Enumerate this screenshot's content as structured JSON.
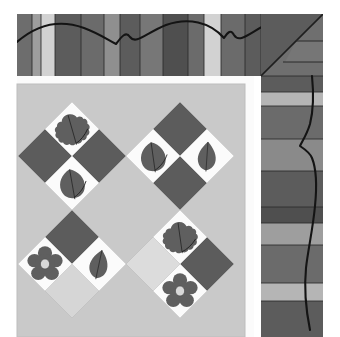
{
  "scene": {
    "title": "Quilt corner photograph",
    "subject": "appliqued leaf and flower quilt block corner with pieced striped borders",
    "canvas": {
      "width": 340,
      "height": 337,
      "background": "#ffffff"
    }
  },
  "palette": {
    "page_background": "#ffffff",
    "sashing_white": "#fbfbfb",
    "center_background": "#c9c9c9",
    "light_gray": "#d2d2d2",
    "pale_gray": "#dedede",
    "medium_gray": "#9e9e9e",
    "dark_gray": "#5c5c5c",
    "darker_gray": "#4f4f4f",
    "mid_dark_gray": "#6b6b6b",
    "appliqué_gray": "#5f5f5f",
    "flower_center": "#d8d8d8",
    "quilting_line": "#1a1a1a",
    "seam_line": "#2b2b2b"
  },
  "layout": {
    "top_border": {
      "x": 17,
      "y": 14,
      "width": 306,
      "height": 62
    },
    "right_border": {
      "x": 261,
      "y": 14,
      "width": 62,
      "height": 323
    },
    "center_panel": {
      "x": 17,
      "y": 84,
      "width": 228,
      "height": 253
    },
    "inner_sashing_vertical": {
      "x": 245,
      "y": 84,
      "width": 9,
      "height": 253
    },
    "inner_sashing_horizontal": {
      "x": 17,
      "y": 76,
      "width": 237,
      "height": 8
    },
    "corner_miter_seam": "diagonal from inner corner to outer corner of border"
  },
  "top_border": {
    "label": "pieced vertical strip border along top edge",
    "strip_count": 14,
    "strips": [
      {
        "index": 0,
        "x": 17,
        "width": 15,
        "color": "#6d6d6d"
      },
      {
        "index": 1,
        "x": 32,
        "width": 9,
        "color": "#9e9e9e"
      },
      {
        "index": 2,
        "x": 41,
        "width": 14,
        "color": "#d2d2d2"
      },
      {
        "index": 3,
        "x": 55,
        "width": 26,
        "color": "#5c5c5c"
      },
      {
        "index": 4,
        "x": 81,
        "width": 23,
        "color": "#6b6b6b"
      },
      {
        "index": 5,
        "x": 104,
        "width": 16,
        "color": "#8f8f8f"
      },
      {
        "index": 6,
        "x": 120,
        "width": 20,
        "color": "#5c5c5c"
      },
      {
        "index": 7,
        "x": 140,
        "width": 23,
        "color": "#777777"
      },
      {
        "index": 8,
        "x": 163,
        "width": 25,
        "color": "#4f4f4f"
      },
      {
        "index": 9,
        "x": 188,
        "width": 16,
        "color": "#6b6b6b"
      },
      {
        "index": 10,
        "x": 204,
        "width": 17,
        "color": "#d2d2d2"
      },
      {
        "index": 11,
        "x": 221,
        "width": 24,
        "color": "#6b6b6b"
      },
      {
        "index": 12,
        "x": 245,
        "width": 16,
        "color": "#5c5c5c"
      },
      {
        "index": 13,
        "x": 261,
        "width": 26,
        "color": "#4f4f4f"
      }
    ],
    "quilting_motif": "continuous scalloped wave with pointed dips"
  },
  "right_border": {
    "label": "pieced horizontal strip border along right edge",
    "strip_count": 12,
    "strips": [
      {
        "index": 0,
        "y": 14,
        "height": 28,
        "color": "#4f4f4f"
      },
      {
        "index": 1,
        "y": 42,
        "height": 24,
        "color": "#6b6b6b"
      },
      {
        "index": 2,
        "y": 66,
        "height": 26,
        "color": "#5c5c5c"
      },
      {
        "index": 3,
        "y": 92,
        "height": 14,
        "color": "#b5b5b5"
      },
      {
        "index": 4,
        "y": 106,
        "height": 33,
        "color": "#6b6b6b"
      },
      {
        "index": 5,
        "y": 139,
        "height": 32,
        "color": "#8a8a8a"
      },
      {
        "index": 6,
        "y": 171,
        "height": 36,
        "color": "#5c5c5c"
      },
      {
        "index": 7,
        "y": 207,
        "height": 16,
        "color": "#4f4f4f"
      },
      {
        "index": 8,
        "y": 223,
        "height": 22,
        "color": "#9e9e9e"
      },
      {
        "index": 9,
        "y": 245,
        "height": 38,
        "color": "#6b6b6b"
      },
      {
        "index": 10,
        "y": 283,
        "height": 18,
        "color": "#b5b5b5"
      },
      {
        "index": 11,
        "y": 301,
        "height": 36,
        "color": "#5c5c5c"
      }
    ],
    "quilting_motif": "vertical serpentine wave line with a sharp notch"
  },
  "center_panel": {
    "label": "on-point diamond block field",
    "background": "#c9c9c9",
    "blocks": [
      {
        "id": "block-leaf-oak-upper-left",
        "motif": "oak-leaf",
        "patch": "white",
        "cx": 72,
        "cy": 129,
        "half": 27,
        "leaf_rotation": -16
      },
      {
        "id": "block-dark-left-upper",
        "motif": "plain",
        "patch": "dark",
        "cx": 45,
        "cy": 156,
        "half": 27
      },
      {
        "id": "block-dark-right-upper",
        "motif": "plain",
        "patch": "dark",
        "cx": 99,
        "cy": 156,
        "half": 27
      },
      {
        "id": "block-leaf-round-left",
        "motif": "round-leaf",
        "patch": "white",
        "cx": 72,
        "cy": 183,
        "half": 27,
        "leaf_rotation": -10
      },
      {
        "id": "block-leaf-round-center",
        "motif": "round-leaf",
        "patch": "white",
        "cx": 153,
        "cy": 156,
        "half": 27,
        "leaf_rotation": -8
      },
      {
        "id": "block-leaf-pointed-right",
        "motif": "pointed-leaf",
        "patch": "white",
        "cx": 207,
        "cy": 156,
        "half": 27,
        "leaf_rotation": 4
      },
      {
        "id": "block-dark-center-upper",
        "motif": "plain",
        "patch": "dark",
        "cx": 180,
        "cy": 129,
        "half": 27
      },
      {
        "id": "block-dark-center-lower",
        "motif": "plain",
        "patch": "dark",
        "cx": 180,
        "cy": 183,
        "half": 27
      },
      {
        "id": "block-flower-lower-left",
        "motif": "flower",
        "patch": "white",
        "cx": 45,
        "cy": 264,
        "half": 27
      },
      {
        "id": "block-dark-lower-left",
        "motif": "plain",
        "patch": "dark",
        "cx": 72,
        "cy": 237,
        "half": 27
      },
      {
        "id": "block-leaf-pointed-lower-left",
        "motif": "pointed-leaf",
        "patch": "white",
        "cx": 99,
        "cy": 264,
        "half": 27,
        "leaf_rotation": 12
      },
      {
        "id": "block-light-lower-left",
        "motif": "plain",
        "patch": "light",
        "cx": 72,
        "cy": 291,
        "half": 27
      },
      {
        "id": "block-leaf-oak-lower-right",
        "motif": "oak-leaf",
        "patch": "white",
        "cx": 180,
        "cy": 237,
        "half": 27,
        "leaf_rotation": -8
      },
      {
        "id": "block-light-lower-center",
        "motif": "plain",
        "patch": "light",
        "cx": 153,
        "cy": 264,
        "half": 27
      },
      {
        "id": "block-dark-lower-right",
        "motif": "plain",
        "patch": "dark",
        "cx": 207,
        "cy": 264,
        "half": 27
      },
      {
        "id": "block-flower-lower-right",
        "motif": "flower",
        "patch": "white",
        "cx": 180,
        "cy": 291,
        "half": 27
      }
    ],
    "motif_counts": {
      "oak_leaf": 2,
      "round_leaf": 3,
      "pointed_leaf": 2,
      "flower": 2,
      "plain_dark": 6,
      "plain_light": 2
    }
  }
}
